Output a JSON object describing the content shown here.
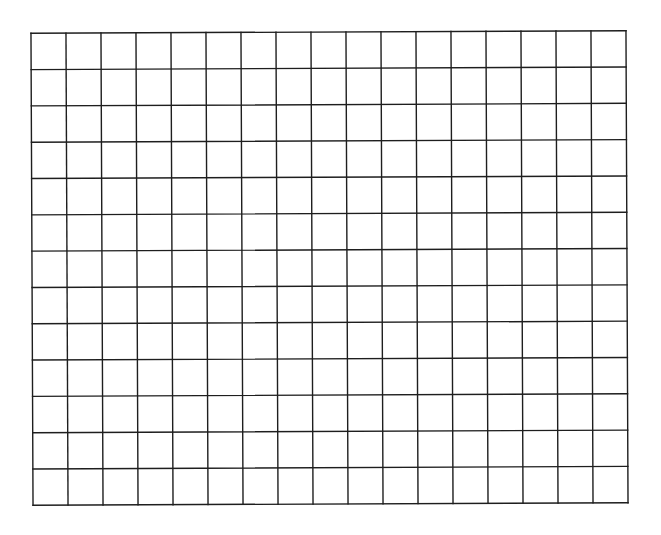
{
  "diagram": {
    "type": "blank-grid",
    "columns": 17,
    "rows": 13,
    "line_color": "#1e1e1e",
    "background_color": "#ffffff",
    "cell_fill": "#ffffff"
  }
}
